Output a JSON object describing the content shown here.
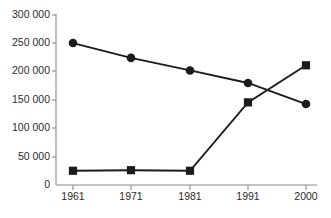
{
  "chart_data": {
    "type": "line",
    "title": "",
    "subtitle": "",
    "xlabel": "",
    "ylabel": "",
    "categories": [
      "1961",
      "1971",
      "1981",
      "1991",
      "2000"
    ],
    "series": [
      {
        "name": "declining-series",
        "marker": "circle",
        "color": "#1c1c1c",
        "values": [
          249000,
          223000,
          201000,
          179000,
          142000
        ]
      },
      {
        "name": "rising-series",
        "marker": "square",
        "color": "#1c1c1c",
        "values": [
          25000,
          26000,
          25000,
          145000,
          210000
        ]
      }
    ],
    "ylim": [
      0,
      300000
    ],
    "yticks": [
      0,
      50000,
      100000,
      150000,
      200000,
      250000,
      300000
    ],
    "ytick_labels": [
      "0",
      "50 000",
      "100 000",
      "150 000",
      "200 000",
      "250 000",
      "300 000"
    ],
    "xtick_labels": [
      "1961",
      "1971",
      "1981",
      "1991",
      "2000"
    ],
    "grid": false,
    "legend": "none",
    "annotations": []
  },
  "axes": {
    "y_axis_name": "value-axis",
    "x_axis_name": "year-axis"
  }
}
